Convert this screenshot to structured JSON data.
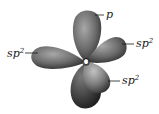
{
  "diagram": {
    "center_atom": "O",
    "labels": {
      "p": "p",
      "sp2_left_base": "sp",
      "sp2_left_sup": "2",
      "sp2_right_base": "sp",
      "sp2_right_sup": "2",
      "sp2_lower_base": "sp",
      "sp2_lower_sup": "2"
    },
    "orbitals": [
      {
        "name": "p orbital (top lobe)",
        "label": "p"
      },
      {
        "name": "sp2 hybrid (left)",
        "label": "sp2"
      },
      {
        "name": "sp2 hybrid (upper right)",
        "label": "sp2"
      },
      {
        "name": "sp2 hybrid (lower right)",
        "label": "sp2"
      },
      {
        "name": "p orbital (bottom lobe)",
        "label": ""
      }
    ],
    "colors": {
      "lobe_light": "#9a9a9a",
      "lobe_dark": "#2b2b2b",
      "leader_line": "#1a1a1a"
    }
  }
}
